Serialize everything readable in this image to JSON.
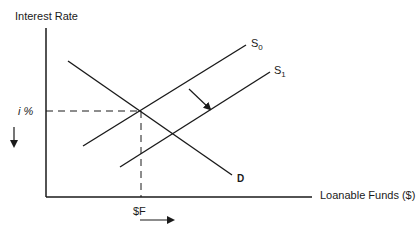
{
  "diagram": {
    "y_axis_label": "Interest Rate",
    "x_axis_label": "Loanable Funds ($)",
    "equilibrium_rate_label": "i %",
    "equilibrium_quantity_label": "$F",
    "curves": [
      {
        "name": "S0",
        "label_main": "S",
        "label_sub": "0",
        "type": "supply"
      },
      {
        "name": "S1",
        "label_main": "S",
        "label_sub": "1",
        "type": "supply"
      },
      {
        "name": "D",
        "label_main": "D",
        "label_sub": "",
        "type": "demand"
      }
    ],
    "annotations": {
      "shift_arrow": "supply shifts right/down from S0 to S1",
      "rate_arrow": "interest rate falls",
      "quantity_arrow": "loanable funds increase"
    },
    "colors": {
      "line": "#1a1a1a",
      "background": "#ffffff"
    }
  }
}
